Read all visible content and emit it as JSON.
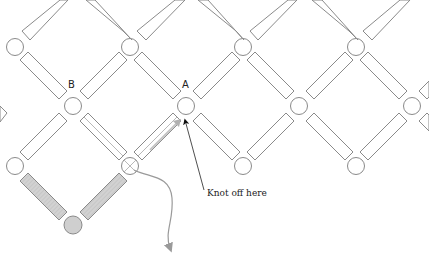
{
  "diagram": {
    "labels": {
      "a": "A",
      "b": "B"
    },
    "annotation": "Knot off here",
    "colors": {
      "outline": "#8a8a8a",
      "shaded_fill": "#cfcfcf",
      "thread": "#9a9a9a",
      "arrow": "#222222"
    },
    "beads": {
      "top_row_y": 47,
      "middle_row_y": 105,
      "bottom_row_y": 165,
      "shaded_bead": {
        "x": 73,
        "y": 223
      },
      "top_row_x": [
        15,
        130,
        243,
        356
      ],
      "middle_row_x": [
        73,
        186,
        299,
        412
      ],
      "bottom_row_x": [
        15,
        130,
        243,
        356
      ]
    }
  }
}
